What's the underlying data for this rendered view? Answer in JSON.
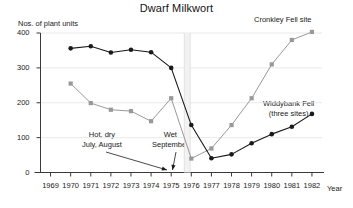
{
  "chart_data": {
    "type": "line",
    "title": "Dwarf Milkwort",
    "xlabel": "Year",
    "ylabel": "Nos. of plant units",
    "xlim": [
      1968.5,
      1982.5
    ],
    "ylim": [
      0,
      400
    ],
    "grid": true,
    "legend_position": "inline-labels",
    "x": [
      1969,
      1970,
      1971,
      1972,
      1973,
      1974,
      1975,
      1976,
      1977,
      1978,
      1979,
      1980,
      1981,
      1982
    ],
    "yticks": [
      0,
      100,
      200,
      300,
      400
    ],
    "xticks": [
      "1969",
      "1970",
      "1971",
      "1972",
      "1973",
      "1974",
      "1975",
      "1976",
      "1977",
      "1978",
      "1979",
      "1980",
      "1981",
      "1982"
    ],
    "series": [
      {
        "name": "Cronkley Fell site",
        "color": "#999999",
        "x": [
          1970,
          1971,
          1972,
          1973,
          1974,
          1975,
          1976,
          1977,
          1978,
          1979,
          1980,
          1981,
          1982
        ],
        "values": [
          255,
          199,
          180,
          176,
          147,
          213,
          40,
          69,
          136,
          213,
          310,
          380,
          403
        ]
      },
      {
        "name": "Widdybank Fell (three sites)",
        "color": "#1a1a1a",
        "x": [
          1970,
          1971,
          1972,
          1973,
          1974,
          1975,
          1976,
          1977,
          1978,
          1979,
          1980,
          1981,
          1982
        ],
        "values": [
          356,
          362,
          344,
          352,
          345,
          300,
          136,
          41,
          52,
          84,
          110,
          131,
          168
        ]
      }
    ],
    "annotations": [
      {
        "name": "hot-dry",
        "text_lines": [
          "Hot, dry",
          "July, August"
        ],
        "points_to_year": 1975.6
      },
      {
        "name": "wet-september",
        "text_lines": [
          "Wet",
          "September"
        ],
        "points_to_year": 1975.75
      }
    ],
    "series_labels": [
      {
        "name": "cronkley",
        "lines": [
          "Cronkley Fell site"
        ]
      },
      {
        "name": "widdybank",
        "lines": [
          "Widdybank Fell",
          "(three sites)"
        ]
      }
    ],
    "event_marker": {
      "label": "1976 drought",
      "year": 1975.8
    }
  }
}
